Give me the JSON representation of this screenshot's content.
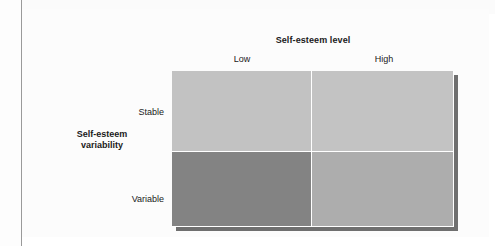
{
  "figure": {
    "column_axis": {
      "title": "Self-esteem level",
      "labels": [
        "Low",
        "High"
      ]
    },
    "row_axis": {
      "title_line1": "Self-esteem",
      "title_line2": "variability",
      "labels": [
        "Stable",
        "Variable"
      ]
    },
    "cells": [
      {
        "row": "Stable",
        "column": "Low",
        "fill": "#c2c2c2"
      },
      {
        "row": "Stable",
        "column": "High",
        "fill": "#c3c3c3"
      },
      {
        "row": "Variable",
        "column": "Low",
        "fill": "#838383"
      },
      {
        "row": "Variable",
        "column": "High",
        "fill": "#adadad"
      }
    ],
    "shadow_color": "#6f6f6f",
    "divider_color": "#ffffff",
    "rule_color": "#9a9a9a",
    "text_color": "#1a1a1a",
    "background": "#ffffff"
  },
  "chart_data": {
    "type": "heatmap",
    "title": "",
    "xlabel": "Self-esteem level",
    "ylabel": "Self-esteem variability",
    "categories": [
      "Low",
      "High"
    ],
    "rows": [
      "Stable",
      "Variable"
    ],
    "grid": false,
    "legend": "none",
    "series": [
      {
        "name": "Stable",
        "values": [
          "#c2c2c2",
          "#c3c3c3"
        ]
      },
      {
        "name": "Variable",
        "values": [
          "#838383",
          "#adadad"
        ]
      }
    ],
    "annotations": []
  }
}
